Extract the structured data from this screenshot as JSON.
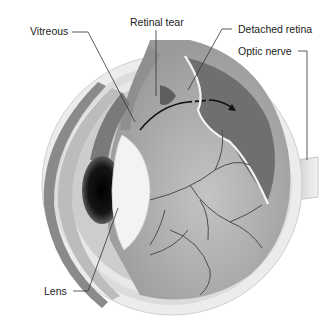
{
  "diagram": {
    "labels": {
      "vitreous": "Vitreous",
      "retinal_tear": "Retinal tear",
      "detached_retina": "Detached retina",
      "optic_nerve": "Optic nerve",
      "lens": "Lens"
    }
  },
  "colors": {
    "background": "#ffffff",
    "outer_sclera": "#e6e6e6",
    "sclera_band": "#cfcfcf",
    "choroid_dark": "#6e6e6e",
    "retina_fill": "#b8b8b8",
    "vitreous_fill": "#a9a9a9",
    "detached_region": "#707070",
    "lens": "#f2f2f2",
    "pupil": "#111111",
    "vessel": "#4a4a4a",
    "leader_line": "#333333",
    "text": "#222222"
  }
}
